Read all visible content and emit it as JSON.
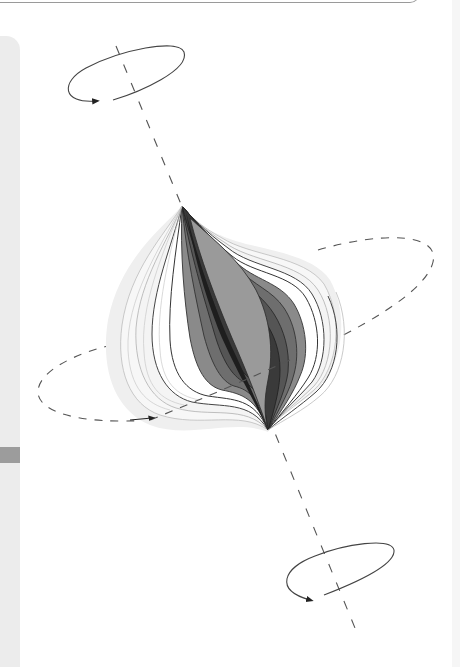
{
  "figure": {
    "type": "vortex-rotation-diagram",
    "colors": {
      "background": "#ffffff",
      "stroke": "#333333",
      "dash": "#555555",
      "layer_lightest": "#f0f0f0",
      "layer_darkest": "#1e1e1e",
      "sidebar": "#ececec",
      "sidebar_tab": "#9c9c9c"
    },
    "elements": {
      "axis_label": "",
      "top_rotation_arrow": "counterclockwise",
      "bottom_rotation_arrow": "counterclockwise",
      "equator_arrow": "toward-right"
    }
  }
}
